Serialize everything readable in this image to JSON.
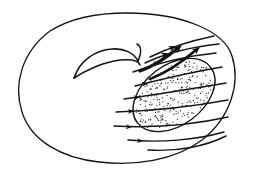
{
  "figure": {
    "kind": "line-drawing",
    "width": 255,
    "height": 172,
    "background_color": "#ffffff",
    "ink_color": "#141414",
    "stipple_color": "#1a1a1a",
    "line_width_outer": 1.3,
    "line_width_flow": 1.4,
    "line_width_blob": 1.4,
    "line_width_lens": 1.6
  },
  "outer_boundary": {
    "name": "surface-outline",
    "shape": "ellipse-irregular",
    "center_x": 127,
    "center_y": 87,
    "radius_x": 107,
    "radius_y": 74,
    "rotation_deg": -3,
    "path": "M 127 13 C 180 13 224 30 232 56 C 241 84 230 118 202 140 C 174 161 134 166 99 162 C 62 158 31 141 22 112 C 13 84 22 52 50 31 C 72 17 100 13 127 13 Z"
  },
  "inner_lens": {
    "name": "handle-fold",
    "description": "lens / eye shaped crease with trailing tail",
    "upper_arc": "M 74 78 C 80 60 96 50 112 49 C 124 48 134 53 138 61",
    "lower_arc": "M 74 78 C 86 70 104 62 120 60 C 132 59 139 61 140 65",
    "tail": "M 138 61 C 142 52 141 46 137 44"
  },
  "stippled_region": {
    "name": "shaded-patch",
    "shape": "tilted-oval",
    "center_x": 174,
    "center_y": 95,
    "radius_x": 46,
    "radius_y": 30,
    "rotation_deg": -37,
    "dot_count": 270,
    "dot_radius": 0.62
  },
  "flow_lines": [
    {
      "id": "flow-1",
      "label": "flow-line-top",
      "path": "M 150 57 C 168 48 190 41 214 36",
      "arrow": {
        "x": 176,
        "y": 46,
        "angle": -24,
        "size": 7.5
      }
    },
    {
      "id": "flow-2",
      "label": "flow-line-upper",
      "path": "M 145 63 C 166 53 191 47 219 44",
      "arrow": {
        "x": 168,
        "y": 53,
        "angle": -22,
        "size": 7.0
      }
    },
    {
      "id": "flow-3",
      "label": "flow-line-upper-mid",
      "path": "M 133 72 C 158 63 186 56 216 53",
      "arrow": {
        "x": 160,
        "y": 62,
        "angle": -18,
        "size": 6.5
      }
    },
    {
      "id": "flow-4",
      "label": "flow-line-mid-a",
      "path": "M 135 86 C 162 79 192 72 222 67",
      "arrow": {
        "x": 148,
        "y": 83,
        "angle": -13,
        "size": 6.2
      }
    },
    {
      "id": "flow-5",
      "label": "flow-line-mid-b",
      "path": "M 124 99 C 155 95 190 89 226 83",
      "arrow": {
        "x": 140,
        "y": 97,
        "angle": -8,
        "size": 6.2
      }
    },
    {
      "id": "flow-6",
      "label": "flow-line-mid-c",
      "path": "M 116 112 C 150 111 190 107 228 100",
      "arrow": {
        "x": 134,
        "y": 111,
        "angle": -4,
        "size": 6.2
      }
    },
    {
      "id": "flow-7",
      "label": "flow-line-lower",
      "path": "M 114 126 C 150 128 192 125 228 117",
      "arrow": {
        "x": 132,
        "y": 127,
        "angle": 2,
        "size": 6.2
      }
    },
    {
      "id": "flow-8",
      "label": "flow-line-bottom",
      "path": "M 128 140 C 160 143 196 140 224 132",
      "arrow": {
        "x": 143,
        "y": 141,
        "angle": 4,
        "size": 6.0
      }
    },
    {
      "id": "flow-9",
      "label": "flow-line-edge",
      "path": "M 148 150 C 178 152 206 146 226 136",
      "arrow": {
        "x": 0,
        "y": 0,
        "angle": 0,
        "size": 0
      }
    }
  ],
  "thick_arrows": [
    {
      "id": "thick-1",
      "label": "converging-arrow-upper",
      "path": "M 140 71 C 154 66 166 58 178 48",
      "width": 3.2,
      "arrow": {
        "x": 182,
        "y": 45,
        "angle": -40,
        "size": 9
      }
    },
    {
      "id": "thick-2",
      "label": "converging-arrow-lower",
      "path": "M 150 79 C 166 73 182 62 196 50",
      "width": 2.8,
      "arrow": {
        "x": 200,
        "y": 47,
        "angle": -40,
        "size": 8
      }
    }
  ]
}
